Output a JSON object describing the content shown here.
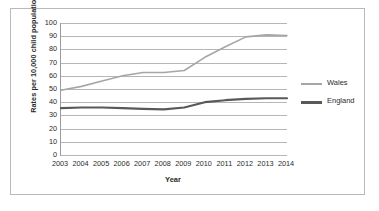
{
  "chart_data": {
    "type": "line",
    "title": "",
    "xlabel": "Year",
    "ylabel": "Rates per 10,000 child population",
    "categories": [
      "2003",
      "2004",
      "2005",
      "2006",
      "2007",
      "2008",
      "2009",
      "2010",
      "2011",
      "2012",
      "2013",
      "2014"
    ],
    "ylim": [
      0,
      100
    ],
    "yticks": [
      0,
      10,
      20,
      30,
      40,
      50,
      60,
      70,
      80,
      90,
      100
    ],
    "grid": true,
    "legend_position": "right",
    "series": [
      {
        "name": "Wales",
        "color": "#a6a6a6",
        "width": 1.6,
        "values": [
          49,
          52,
          56,
          60,
          62.5,
          62.5,
          64,
          74,
          82,
          89.5,
          91,
          90.5
        ]
      },
      {
        "name": "England",
        "color": "#595959",
        "width": 2.2,
        "values": [
          35.5,
          36,
          36,
          35.5,
          35,
          34.5,
          36,
          40,
          41.5,
          42.5,
          43,
          43
        ]
      }
    ]
  }
}
